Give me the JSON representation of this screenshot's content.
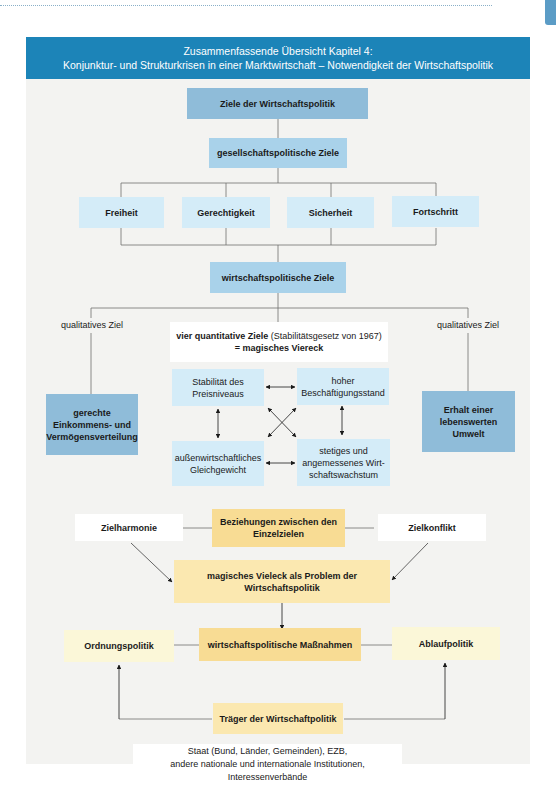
{
  "header": {
    "title_line1": "Zusammenfassende Übersicht Kapitel 4:",
    "title_line2": "Konjunktur- und Strukturkrisen in einer Marktwirtschaft – Notwendigkeit der Wirtschaftspolitik"
  },
  "colors": {
    "header_blue": "#1c84b8",
    "dark_blue_box": "#8fbcd9",
    "mid_blue_box": "#a9d2ea",
    "light_blue_box": "#d4ecf8",
    "gold_box": "#f8dc94",
    "pale_yellow_box": "#fbf7d8",
    "panel_bg": "#f3f3f1"
  },
  "diagram": {
    "root": "Ziele der Wirtschaftspolitik",
    "societal": {
      "label": "gesellschaftspolitische Ziele",
      "items": [
        "Freiheit",
        "Gerechtigkeit",
        "Sicherheit",
        "Fortschritt"
      ]
    },
    "economic": {
      "label": "wirtschaftspolitische Ziele",
      "left_qualitative": {
        "label": "qualitatives Ziel",
        "goal_line1": "gerechte",
        "goal_line2": "Einkommens- und",
        "goal_line3": "Vermögensverteilung"
      },
      "right_qualitative": {
        "label": "qualitatives Ziel",
        "goal_line1": "Erhalt einer",
        "goal_line2": "lebenswerten",
        "goal_line3": "Umwelt"
      },
      "quantitative": {
        "title_bold": "vier quantitative Ziele",
        "title_note": "(Stabilitätsgesetz von 1967)",
        "subtitle": "= magisches Viereck",
        "goals": {
          "top_left_line1": "Stabilität des",
          "top_left_line2": "Preisniveaus",
          "top_right_line1": "hoher",
          "top_right_line2": "Beschäftigungsstand",
          "bottom_left_line1": "außenwirtschaftliches",
          "bottom_left_line2": "Gleichgewicht",
          "bottom_right_line1": "stetiges und",
          "bottom_right_line2": "angemessenes Wirt-",
          "bottom_right_line3": "schaftswachstum"
        }
      }
    },
    "relations": {
      "center_line1": "Beziehungen zwischen den",
      "center_line2": "Einzelzielen",
      "left": "Zielharmonie",
      "right": "Zielkonflikt"
    },
    "problem": {
      "line1": "magisches Vieleck als Problem der",
      "line2": "Wirtschaftspolitik"
    },
    "measures": {
      "center": "wirtschaftspolitische Maßnahmen",
      "left": "Ordnungspolitik",
      "right": "Ablaufpolitik"
    },
    "actors": {
      "label": "Träger der Wirtschaftpolitik",
      "line1": "Staat (Bund, Länder, Gemeinden), EZB,",
      "line2": "andere nationale und internationale Institutionen, Interessenverbände"
    }
  }
}
